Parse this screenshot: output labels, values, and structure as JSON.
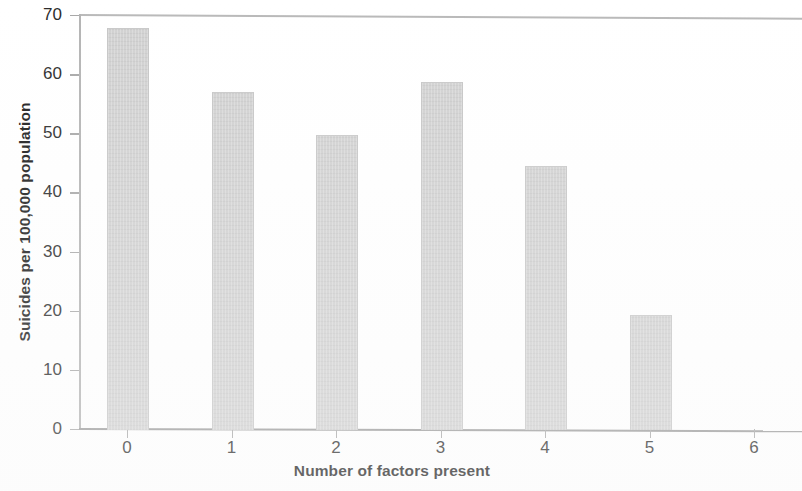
{
  "chart_data": {
    "type": "bar",
    "title": "",
    "subtitle": "",
    "xlabel": "Number of factors present",
    "ylabel": "Suicides per 100,000 population",
    "categories": [
      "0",
      "1",
      "2",
      "3",
      "4",
      "5",
      "6"
    ],
    "values": [
      67.8,
      56.9,
      49.7,
      58.7,
      44.5,
      19.3,
      0
    ],
    "series": [
      {
        "name": "Suicide rate",
        "values": [
          67.8,
          56.9,
          49.7,
          58.7,
          44.5,
          19.3,
          0
        ]
      }
    ],
    "ylim": [
      0,
      70
    ],
    "xlim": [
      -0.5,
      6.5
    ],
    "ytick_labels": [
      "0",
      "10",
      "20",
      "30",
      "40",
      "50",
      "60",
      "70"
    ],
    "ytick_values": [
      0,
      10,
      20,
      30,
      40,
      50,
      60,
      70
    ],
    "xtick_labels": [
      "0",
      "1",
      "2",
      "3",
      "4",
      "5",
      "6"
    ],
    "grid": false,
    "legend": false,
    "legend_position": "none",
    "bar_color": "#cfcfcf",
    "axis_color": "#9a9a9a",
    "text_color": "#1c1c1c",
    "background_color": "#ffffff",
    "annotations": []
  }
}
